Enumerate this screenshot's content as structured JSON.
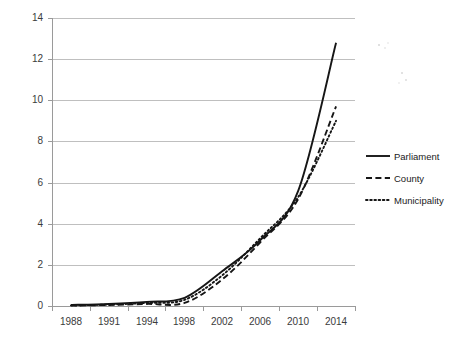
{
  "chart_data": {
    "type": "line",
    "title": "",
    "xlabel": "",
    "ylabel": "",
    "grid": true,
    "legend_position": "right",
    "ylim": [
      0,
      14
    ],
    "yticks": [
      "0",
      "2",
      "4",
      "6",
      "8",
      "10",
      "12",
      "14"
    ],
    "categories": [
      "1988",
      "1991",
      "1994",
      "1998",
      "2002",
      "2006",
      "2010",
      "2014"
    ],
    "series": [
      {
        "name": "Parliament",
        "style": "solid",
        "values": [
          0.05,
          0.1,
          0.2,
          0.4,
          1.7,
          3.2,
          5.6,
          12.8
        ]
      },
      {
        "name": "County",
        "style": "dashed",
        "values": [
          0.02,
          0.05,
          0.1,
          0.15,
          1.3,
          3.1,
          5.2,
          9.7
        ]
      },
      {
        "name": "Municipality",
        "style": "dotted",
        "values": [
          0.03,
          0.07,
          0.15,
          0.3,
          1.5,
          3.3,
          5.3,
          9.0
        ]
      }
    ]
  },
  "axis": {
    "y_labels": [
      "14",
      "12",
      "10",
      "8",
      "6",
      "4",
      "2",
      "0"
    ],
    "x_labels": [
      "1988",
      "1991",
      "1994",
      "1998",
      "2002",
      "2006",
      "2010",
      "2014"
    ]
  },
  "legend": {
    "items": [
      {
        "label": "Parliament"
      },
      {
        "label": "County"
      },
      {
        "label": "Municipality"
      }
    ]
  },
  "colors": {
    "series": "#161616",
    "gridline": "#bfbfbf",
    "axis": "#9a9a9a",
    "text": "#3b3b3b",
    "background": "#ffffff"
  }
}
